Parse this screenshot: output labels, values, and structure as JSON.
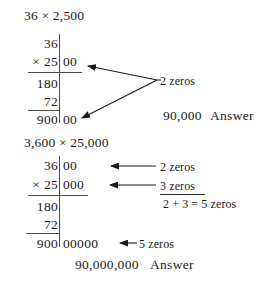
{
  "document": {
    "title": "Multiplying by numbers ending in zeros",
    "background_color": "#ffffff",
    "ink_color": "#1a1a1a",
    "rule_color": "#4a4a4a"
  },
  "example1": {
    "heading": "36 × 2,500",
    "multiplicand": "36",
    "multiplicand_zeros": "",
    "multiplier": "× 25",
    "multiplier_zeros": "00",
    "partial1": "180",
    "partial2": "72",
    "product": "900",
    "product_zeros": "00",
    "annotation_zeros": "2 zeros",
    "answer_value": "90,000",
    "answer_label": "Answer"
  },
  "example2": {
    "heading": "3,600 × 25,000",
    "multiplicand": "36",
    "multiplicand_zeros": "00",
    "multiplier": "× 25",
    "multiplier_zeros": "000",
    "partial1": "180",
    "partial2": "72",
    "product": "900",
    "product_zeros": "00000",
    "annotation_top": "2 zeros",
    "annotation_mid": "3 zeros",
    "annotation_sum": "2 + 3 = 5 zeros",
    "annotation_bottom": "5 zeros",
    "answer_value": "90,000,000",
    "answer_label": "Answer"
  }
}
